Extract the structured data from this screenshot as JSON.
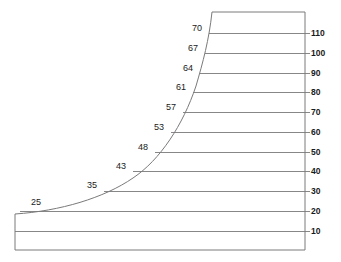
{
  "figure": {
    "type": "engineering-cross-section",
    "background_color": "#ffffff",
    "line_color": "#7a7a7a",
    "text_color": "#1a1a1a",
    "outline": {
      "base_left_x": 15,
      "base_top_y": 214,
      "base_bottom_y": 250,
      "right_x": 305,
      "crest_top_y": 12,
      "crest_left_x": 212
    }
  },
  "chart_data": {
    "type": "line",
    "title": "",
    "xlabel": "",
    "ylabel": "",
    "grid": true,
    "legend_position": "none",
    "right_axis": {
      "label": "",
      "tick_labels": [
        "110",
        "100",
        "90",
        "80",
        "70",
        "60",
        "50",
        "40",
        "30",
        "20",
        "10"
      ],
      "tick_values": [
        110,
        100,
        90,
        80,
        70,
        60,
        50,
        40,
        30,
        20,
        10
      ],
      "tick_pixel_y": [
        33,
        53,
        73,
        92,
        112,
        132,
        152,
        171,
        191,
        211,
        231
      ]
    },
    "face_curve_labels": {
      "values": [
        25,
        35,
        43,
        48,
        53,
        57,
        61,
        64,
        67,
        70
      ],
      "paired_levels": [
        20,
        30,
        40,
        50,
        60,
        70,
        80,
        90,
        100,
        110
      ]
    },
    "contours": [
      {
        "level": "110",
        "value": 110,
        "face_value": "70",
        "y": 33,
        "x_left": 209
      },
      {
        "level": "100",
        "value": 100,
        "face_value": "67",
        "y": 53,
        "x_left": 205
      },
      {
        "level": "90",
        "value": 90,
        "face_value": "64",
        "y": 73,
        "x_left": 200
      },
      {
        "level": "80",
        "value": 80,
        "face_value": "61",
        "y": 92,
        "x_left": 193
      },
      {
        "level": "70",
        "value": 70,
        "face_value": "57",
        "y": 112,
        "x_left": 183
      },
      {
        "level": "60",
        "value": 60,
        "face_value": "53",
        "y": 132,
        "x_left": 171
      },
      {
        "level": "50",
        "value": 50,
        "face_value": "48",
        "y": 152,
        "x_left": 155
      },
      {
        "level": "40",
        "value": 40,
        "face_value": "43",
        "y": 171,
        "x_left": 133
      },
      {
        "level": "30",
        "value": 30,
        "face_value": "35",
        "y": 191,
        "x_left": 104
      },
      {
        "level": "20",
        "value": 20,
        "face_value": "25",
        "y": 211,
        "x_left": 20
      },
      {
        "level": "10",
        "value": 10,
        "face_value": "",
        "y": 231,
        "x_left": 15
      }
    ]
  },
  "labels": {
    "curve": [
      {
        "text": "70",
        "x": 192,
        "y": 24
      },
      {
        "text": "67",
        "x": 188,
        "y": 44
      },
      {
        "text": "64",
        "x": 183,
        "y": 64
      },
      {
        "text": "61",
        "x": 176,
        "y": 83
      },
      {
        "text": "57",
        "x": 166,
        "y": 103
      },
      {
        "text": "53",
        "x": 154,
        "y": 123
      },
      {
        "text": "48",
        "x": 138,
        "y": 143
      },
      {
        "text": "43",
        "x": 116,
        "y": 162
      },
      {
        "text": "35",
        "x": 87,
        "y": 181
      },
      {
        "text": "25",
        "x": 31,
        "y": 198
      }
    ],
    "scale": [
      {
        "text": "110",
        "x": 311,
        "y": 29
      },
      {
        "text": "100",
        "x": 311,
        "y": 49
      },
      {
        "text": "90",
        "x": 311,
        "y": 69
      },
      {
        "text": "80",
        "x": 311,
        "y": 88
      },
      {
        "text": "70",
        "x": 311,
        "y": 108
      },
      {
        "text": "60",
        "x": 311,
        "y": 128
      },
      {
        "text": "50",
        "x": 311,
        "y": 148
      },
      {
        "text": "40",
        "x": 311,
        "y": 167
      },
      {
        "text": "30",
        "x": 311,
        "y": 187
      },
      {
        "text": "20",
        "x": 311,
        "y": 207
      },
      {
        "text": "10",
        "x": 311,
        "y": 227
      }
    ]
  }
}
